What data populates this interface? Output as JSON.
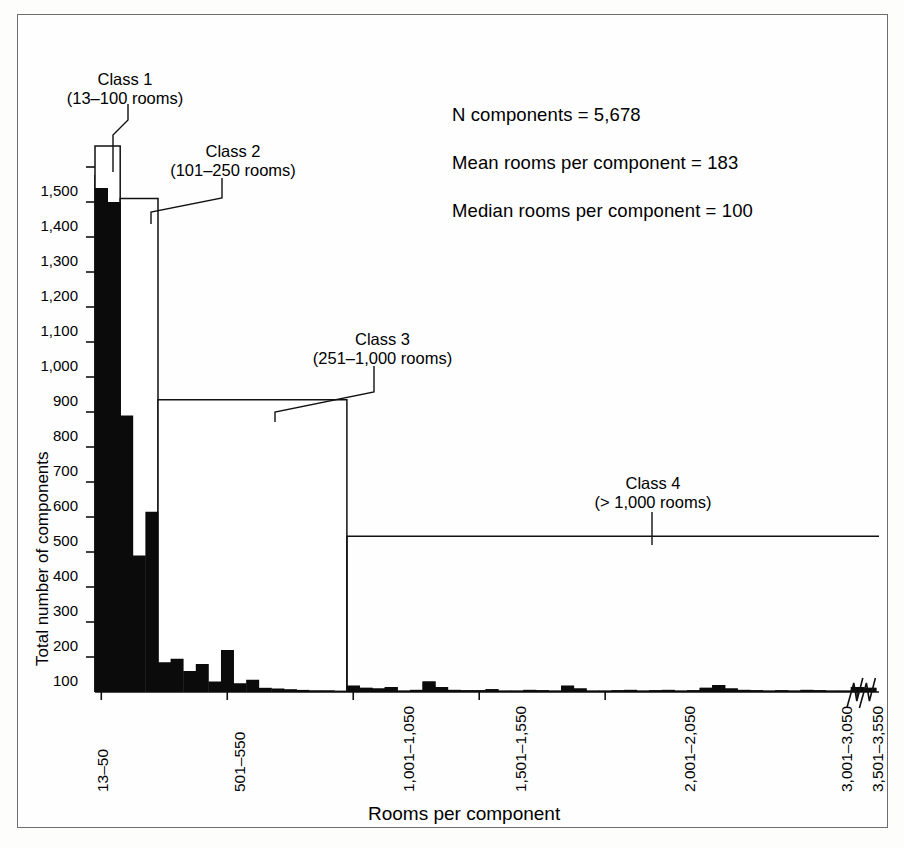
{
  "chart_data": {
    "type": "bar",
    "title": "",
    "xlabel": "Rooms per component",
    "ylabel": "Total number of components",
    "ylim": [
      0,
      1560
    ],
    "grid": false,
    "legend": "none",
    "bin_width_rooms": 50,
    "bin_start_rooms": 13,
    "y_ticks": [
      100,
      200,
      300,
      400,
      500,
      600,
      700,
      800,
      900,
      1000,
      1100,
      1200,
      1300,
      1400,
      1500
    ],
    "y_tick_labels": [
      "100",
      "200",
      "300",
      "400",
      "500",
      "600",
      "700",
      "800",
      "900",
      "1,000",
      "1,100",
      "1,200",
      "1,300",
      "1,400",
      "1,500"
    ],
    "x_tick_labels": [
      "13–50",
      "501–550",
      "1,001–1,050",
      "1,501–1,550",
      "2,001–2,050",
      "3,001–3,050",
      "3,501–3,550"
    ],
    "x_tick_bin_index": [
      0,
      10,
      20,
      30,
      40,
      60,
      70
    ],
    "categories": [
      "13–50",
      "51–100",
      "101–150",
      "151–200",
      "201–250",
      "251–300",
      "301–350",
      "351–400",
      "401–450",
      "451–500",
      "501–550",
      "551–600",
      "601–650",
      "651–700",
      "701–750",
      "751–800",
      "801–850",
      "851–900",
      "901–950",
      "951–1,000",
      "1,001–1,050",
      "1,051–1,100",
      "1,101–1,150",
      "1,151–1,200",
      "1,201–1,250",
      "1,251–1,300",
      "1,301–1,350",
      "1,351–1,400",
      "1,401–1,450",
      "1,451–1,500",
      "1,501–1,550",
      "1,551–1,600",
      "1,601–1,650",
      "1,651–1,700",
      "1,701–1,750",
      "1,751–1,800",
      "1,801–1,850",
      "1,851–1,900",
      "1,901–1,950",
      "1,951–2,000",
      "2,001–2,050",
      "2,051–2,100",
      "2,101–2,150",
      "2,151–2,200",
      "2,201–2,250",
      "2,251–2,300",
      "2,301–2,350",
      "2,351–2,400",
      "2,401–2,450",
      "2,451–2,500",
      "2,501–2,550",
      "2,551–2,600",
      "2,601–2,650",
      "2,651–2,700",
      "2,701–2,750",
      "2,751–2,800",
      "2,801–2,850",
      "2,851–2,900",
      "2,901–2,950",
      "2,951–3,000",
      "3,001–3,050",
      "3,501–3,550"
    ],
    "values": [
      1440,
      1400,
      790,
      390,
      515,
      85,
      95,
      60,
      80,
      30,
      120,
      25,
      35,
      12,
      10,
      8,
      6,
      5,
      5,
      4,
      18,
      12,
      10,
      14,
      4,
      6,
      30,
      14,
      6,
      5,
      5,
      8,
      4,
      4,
      6,
      5,
      4,
      18,
      10,
      4,
      4,
      5,
      6,
      4,
      5,
      6,
      4,
      5,
      12,
      20,
      10,
      6,
      5,
      4,
      5,
      4,
      6,
      5,
      4,
      4,
      14,
      12
    ],
    "axis_breaks_after_bin": [
      60,
      61
    ],
    "annotations": [
      "N components = 5,678",
      "Mean rooms per component = 183",
      "Median rooms per component = 100"
    ],
    "class_brackets": [
      {
        "name": "Class 1",
        "range": "(13–100 rooms)",
        "top_value": 1560,
        "bin_from": 0,
        "bin_to": 2
      },
      {
        "name": "Class 2",
        "range": "(101–250 rooms)",
        "top_value": 1410,
        "bin_from": 2,
        "bin_to": 5
      },
      {
        "name": "Class 3",
        "range": "(251–1,000 rooms)",
        "top_value": 835,
        "bin_from": 5,
        "bin_to": 20
      },
      {
        "name": "Class 4",
        "range": "(> 1,000 rooms)",
        "top_value": 445,
        "bin_from": 20,
        "bin_to": 62
      }
    ]
  }
}
